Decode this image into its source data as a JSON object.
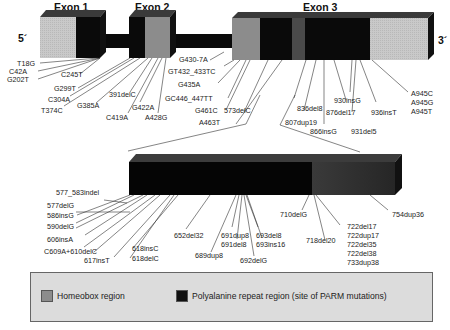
{
  "figure": {
    "ends": {
      "five_prime": "5´",
      "three_prime": "3´"
    },
    "exons": [
      {
        "label": "Exon 1"
      },
      {
        "label": "Exon 2"
      },
      {
        "label": "Exon 3"
      }
    ],
    "colors": {
      "homeobox": "#8c8c8c",
      "polyalanine": "#0a0a0a",
      "utr_light": "#c8c8c8",
      "box_top": "#3a3a3a",
      "expanded_tail": "#2e2e2e",
      "legend_bg": "#dcdcdc"
    },
    "gene_mutations_left": [
      "T18G",
      "C42A",
      "G202T",
      "C245T",
      "G299T",
      "C304A",
      "T374C",
      "G385A",
      "391delC",
      "C419A",
      "G422A",
      "A428G"
    ],
    "gene_mutations_mid": [
      "G430-7A",
      "GT432_433TC",
      "G435A",
      "GC446_447TT",
      "G461C",
      "A463T",
      "573delC"
    ],
    "gene_mutations_right": [
      "807dup19",
      "836del8",
      "866insG",
      "876del17",
      "930insG",
      "931del5",
      "936insT",
      "A945C",
      "A945G",
      "A945T"
    ],
    "expanded_mutations_left": [
      "577_583indel",
      "577delG",
      "586insG",
      "590delG",
      "606insA",
      "C609A+610delC",
      "617insT",
      "618insC",
      "618delC"
    ],
    "expanded_mutations_mid": [
      "652del32",
      "689dup8",
      "691dup8",
      "691del8",
      "692delG",
      "693del8",
      "693ins16"
    ],
    "expanded_mutations_right": [
      "710delG",
      "718del20",
      "722del17",
      "722dup17",
      "722del35",
      "722del38",
      "733dup38",
      "754dup36"
    ]
  },
  "legend": {
    "items": [
      {
        "label": "Homeobox region",
        "color": "#8c8c8c"
      },
      {
        "label": "Polyalanine repeat region (site of PARM mutations)",
        "color": "#111111"
      }
    ]
  }
}
